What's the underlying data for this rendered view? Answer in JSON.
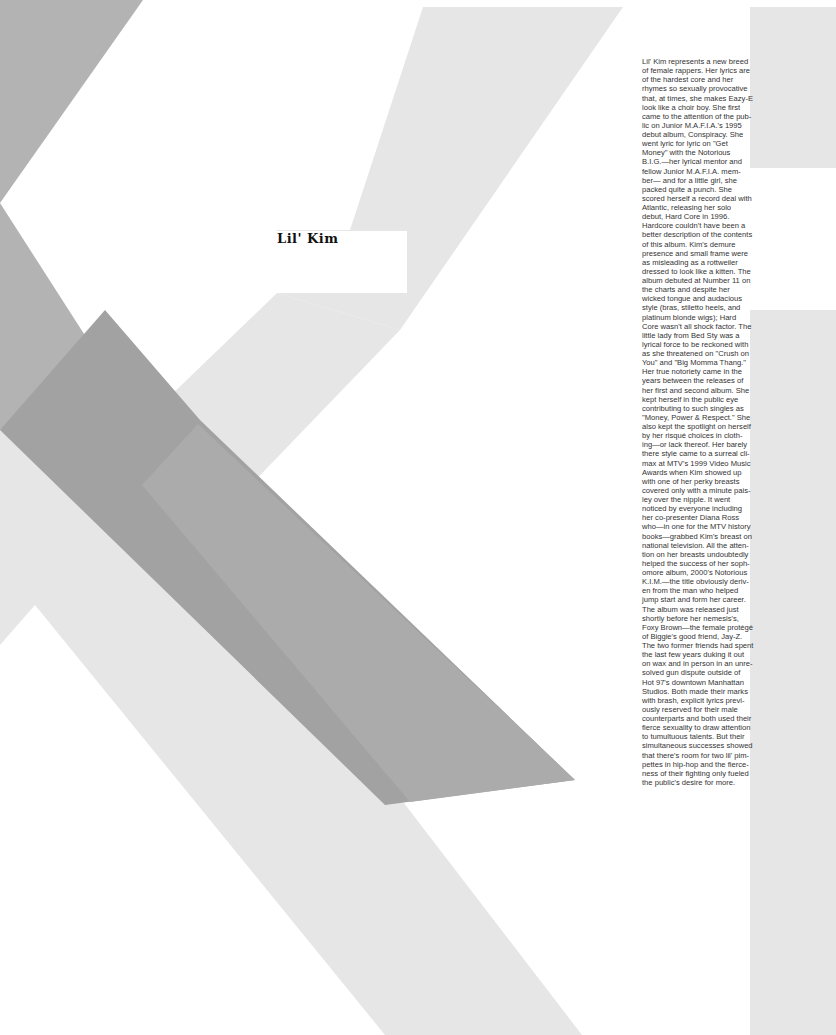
{
  "article": {
    "title": "Lil' Kim",
    "body_lines": [
      "Lil' Kim represents a new breed",
      "of female rappers. Her lyrics are",
      "of the hardest core and her",
      "rhymes so sexually provocative",
      "that, at times, she makes Eazy-E",
      "look like a choir boy. She first",
      "came to the attention of the pub-",
      "lic on Junior M.A.F.I.A.'s 1995",
      "debut album, Conspiracy. She",
      "went lyric for lyric on \"Get",
      "Money\" with the Notorious",
      "B.I.G.—her lyrical mentor and",
      "fellow Junior M.A.F.I.A. mem-",
      "ber— and for a little girl, she",
      "packed quite a punch. She",
      "scored herself a record deal with",
      "Atlantic, releasing her solo",
      "debut, Hard Core in 1996.",
      "Hardcore couldn't have been a",
      "better description of the contents",
      "of this album. Kim's demure",
      "presence and small frame were",
      "as misleading as a rottweiler",
      "dressed to look like a kitten. The",
      "album debuted at Number 11 on",
      "the charts and despite her",
      "wicked tongue and audacious",
      "style (bras, stiletto heels, and",
      "platinum blonde wigs); Hard",
      "Core wasn't all shock factor. The",
      "little lady from Bed Sty was a",
      "lyrical force to be reckoned with",
      "as she threatened on \"Crush on",
      "You\" and \"Big Momma Thang.\"",
      "Her true notoriety came in the",
      "years between the releases of",
      "her first and second album. She",
      "kept herself in the public eye",
      "contributing to such singles as",
      "\"Money, Power & Respect.\" She",
      "also kept the spotlight on herself",
      "by her risqué choices in cloth-",
      "ing—or lack thereof. Her barely",
      "there style came to a surreal cli-",
      "max at MTV's 1999 Video Music",
      "Awards when Kim showed up",
      "with one of her perky breasts",
      "covered only with a minute pais-",
      "ley over the nipple. It went",
      "noticed by everyone including",
      "her co-presenter Diana Ross",
      "who—in one for the MTV history",
      "books—grabbed Kim's breast on",
      "national television. All the atten-",
      "tion on her breasts undoubtedly",
      "helped the success of her soph-",
      "omore album, 2000's Notorious",
      "K.I.M.—the title obviously deriv-",
      "en from the man who helped",
      "jump start and form her career.",
      "The album was released just",
      "shortly before her nemesis's,",
      "Foxy Brown—the female protégé",
      "of Biggie's good friend, Jay-Z.",
      "The two former friends had spent",
      "the last few years duking it out",
      "on wax and in person in an unre-",
      "solved gun dispute outside of",
      "Hot 97's downtown Manhattan",
      "Studios. Both made their marks",
      "with brash, explicit lyrics previ-",
      "ously reserved for their male",
      "counterparts and both used their",
      "fierce sexuality to draw attention",
      "to tumultuous talents. But their",
      "simultaneous successes showed",
      "that there's room for two lil' pim-",
      "pettes in hip-hop and the fierce-",
      "ness of their fighting only fueled",
      "the public's desire for more."
    ]
  },
  "colors": {
    "light_gray": "#e6e6e6",
    "mid_gray": "#b3b3b3",
    "dark_gray": "#a2a2a2",
    "band_gray": "#ababab",
    "text": "#333333",
    "title": "#111111"
  }
}
